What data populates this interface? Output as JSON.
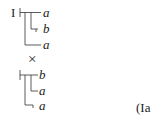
{
  "formula": {
    "label_left": "I",
    "tree1": {
      "leaves": [
        "a",
        "b",
        "a"
      ]
    },
    "operator": "×",
    "tree2": {
      "leaves": [
        "b",
        "a",
        "a"
      ]
    },
    "equation_ref": "(Ia"
  }
}
